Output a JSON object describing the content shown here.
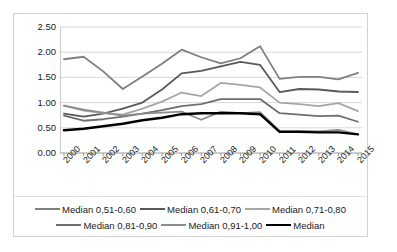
{
  "chart_data": {
    "type": "line",
    "title": "",
    "xlabel": "",
    "ylabel": "",
    "x": [
      "2000",
      "2001",
      "2002",
      "2003",
      "2004",
      "2005",
      "2006",
      "2007",
      "2008",
      "2009",
      "2010",
      "2011",
      "2012",
      "2013",
      "2014",
      "2015"
    ],
    "ylim": [
      0.0,
      2.5
    ],
    "yticks": [
      "0.00",
      "0.50",
      "1.00",
      "1.50",
      "2.00",
      "2.50"
    ],
    "ytick_values": [
      0.0,
      0.5,
      1.0,
      1.5,
      2.0,
      2.5
    ],
    "grid": true,
    "legend_position": "bottom",
    "series": [
      {
        "name": "Median 0,51-0,60",
        "color": "#7f7f7f",
        "width": 1.8,
        "values": [
          1.86,
          1.91,
          1.62,
          1.27,
          1.52,
          1.77,
          2.05,
          1.9,
          1.78,
          1.88,
          2.12,
          1.47,
          1.51,
          1.51,
          1.46,
          1.59
        ]
      },
      {
        "name": "Median 0,61-0,70",
        "color": "#595959",
        "width": 1.8,
        "values": [
          0.78,
          0.72,
          0.78,
          0.88,
          1.0,
          1.26,
          1.58,
          1.63,
          1.72,
          1.81,
          1.75,
          1.21,
          1.27,
          1.26,
          1.22,
          1.21
        ]
      },
      {
        "name": "Median 0,71-0,80",
        "color": "#a6a6a6",
        "width": 1.8,
        "values": [
          0.94,
          0.84,
          0.79,
          0.76,
          0.88,
          1.02,
          1.2,
          1.13,
          1.39,
          1.35,
          1.3,
          1.0,
          0.97,
          0.93,
          0.99,
          0.83
        ]
      },
      {
        "name": "Median 0,81-0,90",
        "color": "#6e6e6e",
        "width": 1.8,
        "values": [
          0.74,
          0.64,
          0.67,
          0.72,
          0.78,
          0.85,
          0.93,
          0.97,
          1.07,
          1.07,
          1.07,
          0.79,
          0.76,
          0.73,
          0.74,
          0.62
        ]
      },
      {
        "name": "Median 0,91-1,00",
        "color": "#8c8c8c",
        "width": 1.8,
        "values": [
          0.94,
          0.86,
          0.8,
          0.74,
          0.78,
          0.8,
          0.82,
          0.66,
          0.82,
          0.79,
          0.81,
          0.44,
          0.44,
          0.43,
          0.46,
          0.37
        ]
      },
      {
        "name": "Median",
        "color": "#000000",
        "width": 2.4,
        "values": [
          0.45,
          0.48,
          0.53,
          0.58,
          0.65,
          0.7,
          0.77,
          0.79,
          0.79,
          0.79,
          0.77,
          0.42,
          0.42,
          0.41,
          0.41,
          0.37
        ]
      }
    ]
  },
  "legend": {
    "rows": [
      [
        "Median 0,51-0,60",
        "Median 0,61-0,70",
        "Median 0,71-0,80"
      ],
      [
        "Median 0,81-0,90",
        "Median 0,91-1,00",
        "Median"
      ]
    ]
  }
}
